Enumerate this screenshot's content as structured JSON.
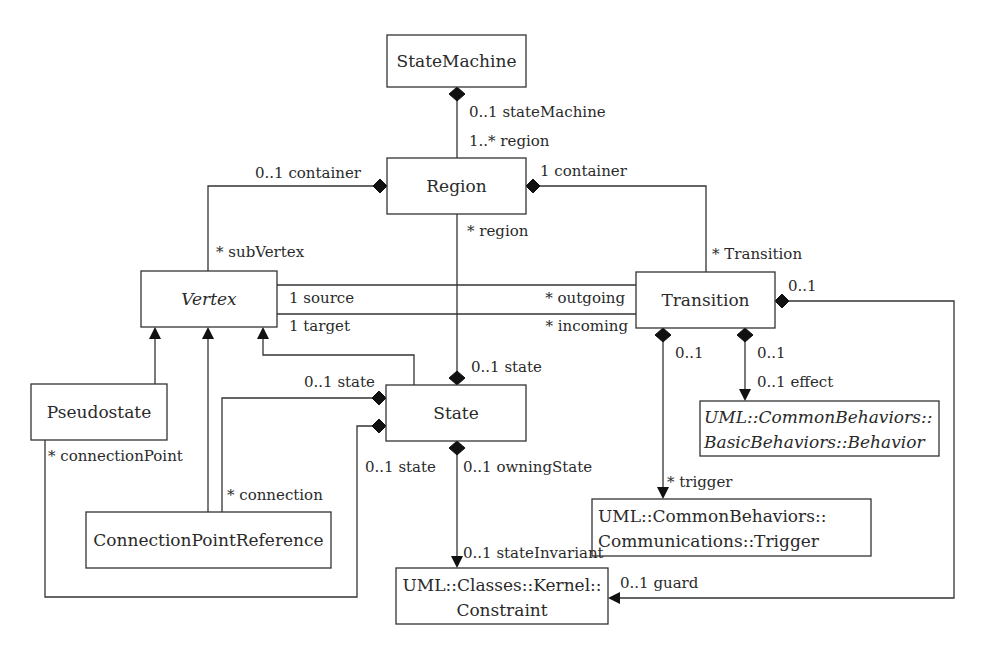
{
  "diagram": {
    "type": "UML class diagram (metamodel)",
    "classes": {
      "state_machine": "StateMachine",
      "region": "Region",
      "vertex": "Vertex",
      "transition": "Transition",
      "pseudostate": "Pseudostate",
      "state": "State",
      "connection_point_reference": "ConnectionPointReference",
      "behavior": {
        "line1": "UML::CommonBehaviors::",
        "line2": "BasicBehaviors::Behavior"
      },
      "trigger": {
        "line1": "UML::CommonBehaviors::",
        "line2": "Communications::Trigger"
      },
      "constraint": {
        "line1": "UML::Classes::Kernel::",
        "line2": "Constraint"
      }
    },
    "labels": {
      "sm_state_machine": "0..1 stateMachine",
      "sm_region": "1..* region",
      "region_container_left": "0..1 container",
      "region_container_right": "1 container",
      "sub_vertex": "* subVertex",
      "region_region": "* region",
      "transition_end": "* Transition",
      "source": "1 source",
      "target": "1 target",
      "outgoing": "* outgoing",
      "incoming": "* incoming",
      "transition_guard_owner": "0..1",
      "state_from_region": "0..1 state",
      "state_connection": "0..1 state",
      "state_connection_point": "0..1 state",
      "connection_point": "* connectionPoint",
      "connection": "* connection",
      "owning_state": "0..1 owningState",
      "state_invariant": "0..1 stateInvariant",
      "trigger_owner": "0..1",
      "trigger_end": "* trigger",
      "effect_owner": "0..1",
      "effect_end": "0..1 effect",
      "guard": "0..1 guard"
    }
  }
}
